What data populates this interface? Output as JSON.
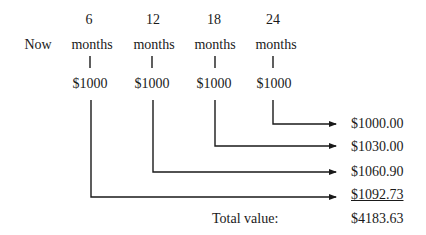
{
  "timeline": {
    "now_label": "Now",
    "periods": [
      {
        "number": "6",
        "unit": "months",
        "payment": "$1000"
      },
      {
        "number": "12",
        "unit": "months",
        "payment": "$1000"
      },
      {
        "number": "18",
        "unit": "months",
        "payment": "$1000"
      },
      {
        "number": "24",
        "unit": "months",
        "payment": "$1000"
      }
    ]
  },
  "future_values": [
    {
      "value": "$1000.00",
      "from_period": "24"
    },
    {
      "value": "$1030.00",
      "from_period": "18"
    },
    {
      "value": "$1060.90",
      "from_period": "12"
    },
    {
      "value": "$1092.73",
      "from_period": "6",
      "underlined": true
    }
  ],
  "total": {
    "label": "Total value:",
    "value": "$4183.63"
  },
  "colors": {
    "line": "#1a1a1a",
    "background": "#ffffff"
  }
}
